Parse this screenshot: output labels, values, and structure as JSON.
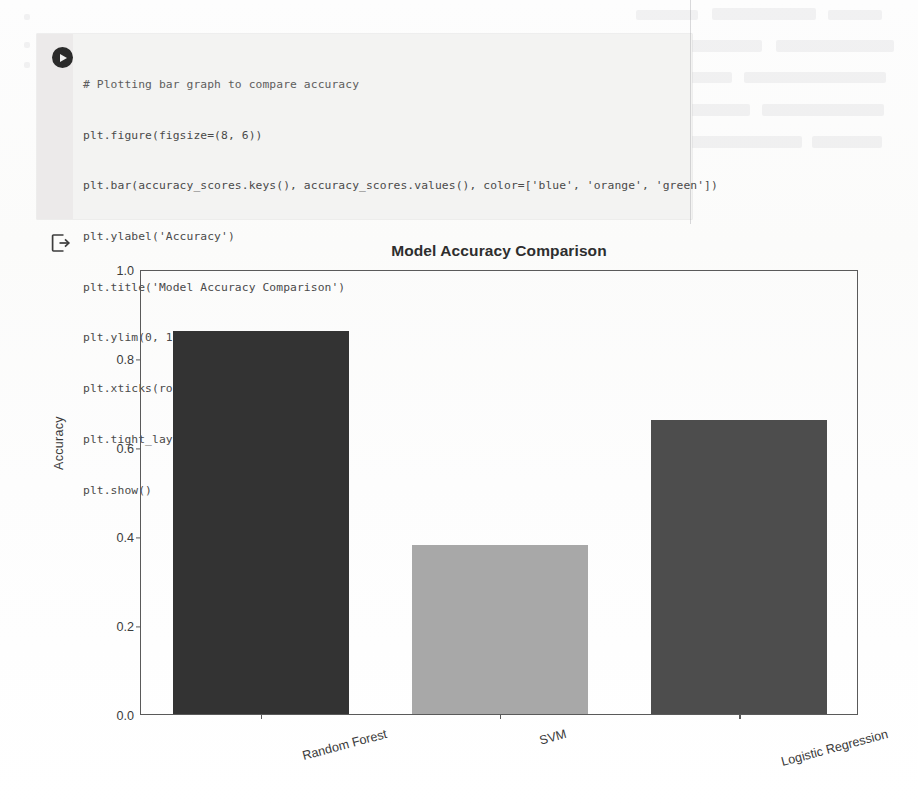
{
  "notebook": {
    "run_button_icon": "play-circle-icon",
    "output_icon": "output-export-icon",
    "code_lines": [
      "# Plotting bar graph to compare accuracy",
      "plt.figure(figsize=(8, 6))",
      "plt.bar(accuracy_scores.keys(), accuracy_scores.values(), color=['blue', 'orange', 'green'])",
      "plt.ylabel('Accuracy')",
      "plt.title('Model Accuracy Comparison')",
      "plt.ylim(0, 1)",
      "plt.xticks(rotation=15)",
      "plt.tight_layout()",
      "plt.show()"
    ]
  },
  "chart_data": {
    "type": "bar",
    "title": "Model Accuracy Comparison",
    "xlabel": "",
    "ylabel": "Accuracy",
    "categories": [
      "Random Forest",
      "SVM",
      "Logistic Regression"
    ],
    "values": [
      0.86,
      0.38,
      0.66
    ],
    "ylim": [
      0.0,
      1.0
    ],
    "yticks": [
      "1.0",
      "0.8",
      "0.6",
      "0.4",
      "0.2",
      "0.0"
    ],
    "ytick_values": [
      1.0,
      0.8,
      0.6,
      0.4,
      0.2,
      0.0
    ],
    "xtick_rotation": 15,
    "grid": false,
    "legend": "none",
    "bar_colors": [
      "#333333",
      "#a8a8a8",
      "#4d4d4d"
    ],
    "declared_colors": [
      "blue",
      "orange",
      "green"
    ],
    "figsize": "(8, 6)"
  },
  "style": {
    "cell_background": "#f3f3f2",
    "gutter_background": "#eceaea",
    "axis_color": "#5a5a5a",
    "text_color": "#333333",
    "page_background": "#ffffff"
  }
}
